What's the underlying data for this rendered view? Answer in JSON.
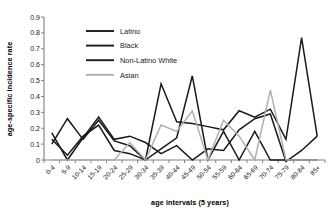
{
  "chart_data": {
    "type": "line",
    "title": "",
    "xlabel": "age intervals (5 years)",
    "ylabel": "age-specific incidence rate",
    "ylim": [
      0,
      0.9
    ],
    "yticks": [
      "0",
      "0.1",
      "0.2",
      "0.3",
      "0.4",
      "0.5",
      "0.6",
      "0.7",
      "0.8",
      "0.9"
    ],
    "ytick_values": [
      0,
      0.1,
      0.2,
      0.3,
      0.4,
      0.5,
      0.6,
      0.7,
      0.8,
      0.9
    ],
    "grid": false,
    "legend_position": "upper-left-inside",
    "categories": [
      "0-4",
      "5-9",
      "10-14",
      "15-19",
      "20-24",
      "25-29",
      "30-34",
      "35-39",
      "40-44",
      "45-49",
      "50-54",
      "55-59",
      "60-64",
      "65-69",
      "70-74",
      "75-79",
      "80-84",
      "85+"
    ],
    "series": [
      {
        "name": "Latino",
        "color": "#1a1a1a",
        "values": [
          0.1,
          0.26,
          0.13,
          0.25,
          0.12,
          0.09,
          0.0,
          0.48,
          0.24,
          0.23,
          0.21,
          0.19,
          0.31,
          0.27,
          0.32,
          0.13,
          0.77,
          0.15
        ]
      },
      {
        "name": "Black",
        "color": "#1a1a1a",
        "values": [
          0.17,
          0.0,
          0.14,
          0.27,
          0.13,
          0.15,
          0.11,
          0.04,
          0.09,
          0.0,
          0.07,
          0.06,
          0.19,
          0.26,
          0.29,
          -0.01,
          0.06,
          0.15
        ]
      },
      {
        "name": "Non-Latino White",
        "color": "#1a1a1a",
        "values": [
          0.13,
          0.03,
          0.15,
          0.22,
          0.06,
          0.04,
          0.0,
          0.07,
          0.14,
          0.53,
          0.0,
          0.18,
          0.0,
          0.18,
          0.0,
          0.0,
          0.0,
          0.0
        ]
      },
      {
        "name": "Asian",
        "color": "#b0b0b0",
        "values": [
          0.0,
          0.0,
          0.0,
          0.0,
          0.0,
          0.11,
          0.0,
          0.22,
          0.18,
          0.31,
          0.0,
          0.25,
          0.15,
          0.0,
          0.44,
          0.0,
          0.0,
          0.0
        ]
      }
    ]
  },
  "legend": {
    "items": [
      {
        "label": "Latino"
      },
      {
        "label": "Black"
      },
      {
        "label": "Non-Latino White"
      },
      {
        "label": "Asian"
      }
    ]
  },
  "axes": {
    "y_title": "age-specific incidence rate",
    "x_title": "age intervals (5 years)"
  }
}
